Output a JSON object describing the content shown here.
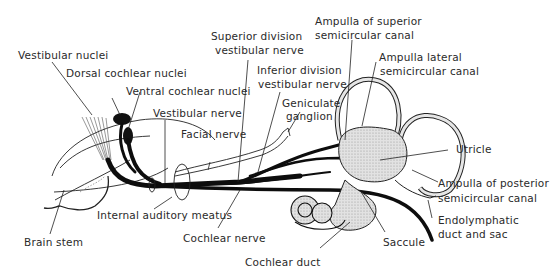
{
  "diagram": {
    "labels": {
      "vestibular_nuclei": "Vestibular nuclei",
      "dorsal_cochlear_nuclei": "Dorsal cochlear nuclei",
      "ventral_cochlear_nuclei": "Ventral cochlear nuclei",
      "vestibular_nerve": "Vestibular nerve",
      "facial_nerve": "Facial nerve",
      "superior_division_l1": "Superior division",
      "superior_division_l2": "vestibular nerve",
      "inferior_division_l1": "Inferior division",
      "inferior_division_l2": "vestibular nerve",
      "geniculate_l1": "Geniculate",
      "geniculate_l2": "ganglion",
      "ampulla_superior_l1": "Ampulla of superior",
      "ampulla_superior_l2": "semicircular canal",
      "ampulla_lateral_l1": "Ampulla lateral",
      "ampulla_lateral_l2": "semicircular canal",
      "utricle": "Utricle",
      "ampulla_posterior_l1": "Ampulla of posterior",
      "ampulla_posterior_l2": "semicircular canal",
      "endolymphatic_l1": "Endolymphatic",
      "endolymphatic_l2": "duct and sac",
      "saccule": "Saccule",
      "cochlear_duct": "Cochlear duct",
      "cochlear_nerve": "Cochlear nerve",
      "internal_auditory_meatus": "Internal auditory meatus",
      "brain_stem": "Brain stem"
    },
    "colors": {
      "line": "#111111",
      "label": "#2a2a2a",
      "membrane_fill": "#d4d4d4"
    }
  }
}
